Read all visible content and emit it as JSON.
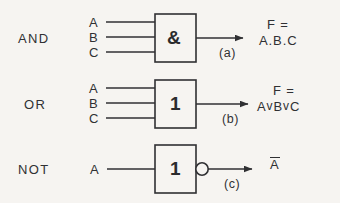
{
  "figure": {
    "background_color": "#f6f4f1",
    "ink_color": "#303033"
  },
  "rows": [
    {
      "gate_label": "AND",
      "body_symbol": "&",
      "inputs": [
        "A",
        "B",
        "C"
      ],
      "output_expression_line1": "F =",
      "output_expression_line2": "A.B.C",
      "caption": "(a)",
      "inverted_output": false
    },
    {
      "gate_label": "OR",
      "body_symbol": "1",
      "inputs": [
        "A",
        "B",
        "C"
      ],
      "output_expression_line1": "F =",
      "output_expression_line2_parts": [
        "A",
        "v",
        "B",
        "v",
        "C"
      ],
      "caption": "(b)",
      "inverted_output": false
    },
    {
      "gate_label": "NOT",
      "body_symbol": "1",
      "inputs": [
        "A"
      ],
      "output_expression_line1": "A",
      "output_overbar": true,
      "caption": "(c)",
      "inverted_output": true
    }
  ]
}
